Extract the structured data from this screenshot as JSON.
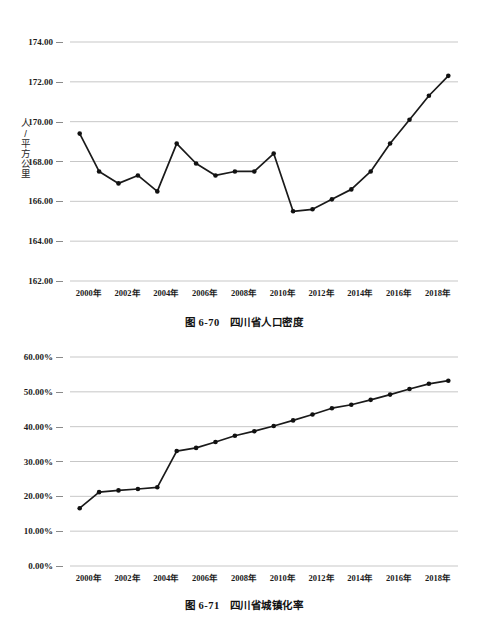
{
  "page": {
    "faint_header": "",
    "background": "#ffffff"
  },
  "figures": [
    {
      "id": "figure-6-70",
      "caption_number": "图 6-70",
      "caption_title": "四川省人口密度",
      "y_axis_title": "人/平方公里"
    },
    {
      "id": "figure-6-71",
      "caption_number": "图 6-71",
      "caption_title": "四川省城镇化率",
      "y_axis_title": ""
    }
  ],
  "chart_data": [
    {
      "type": "line",
      "title": "图 6-70  四川省人口密度",
      "xlabel": "",
      "ylabel": "人/平方公里",
      "ylim": [
        162.0,
        174.0
      ],
      "ytick_labels": [
        "174.00",
        "172.00",
        "170.00",
        "168.00",
        "166.00",
        "164.00",
        "162.00"
      ],
      "ytick_values": [
        174.0,
        172.0,
        170.0,
        168.0,
        166.0,
        164.0,
        162.0
      ],
      "xtick_labels": [
        "2000年",
        "2002年",
        "2004年",
        "2006年",
        "2008年",
        "2010年",
        "2012年",
        "2014年",
        "2016年",
        "2018年"
      ],
      "x": [
        "2000年",
        "2001年",
        "2002年",
        "2003年",
        "2004年",
        "2005年",
        "2006年",
        "2007年",
        "2008年",
        "2009年",
        "2010年",
        "2011年",
        "2012年",
        "2013年",
        "2014年",
        "2015年",
        "2016年",
        "2017年",
        "2018年",
        "2019年"
      ],
      "values": [
        169.4,
        167.5,
        166.9,
        167.3,
        166.5,
        168.9,
        167.9,
        167.3,
        167.5,
        167.5,
        168.4,
        165.5,
        165.6,
        166.1,
        166.6,
        167.5,
        168.9,
        170.1,
        171.3,
        172.3
      ],
      "grid": true,
      "legend": "none",
      "markers": true,
      "line_color": "#1a1a1a"
    },
    {
      "type": "line",
      "title": "图 6-71  四川省城镇化率",
      "xlabel": "",
      "ylabel": "",
      "ylim": [
        0.0,
        60.0
      ],
      "ytick_labels": [
        "60.00%",
        "50.00%",
        "40.00%",
        "30.00%",
        "20.00%",
        "10.00%",
        "0.00%"
      ],
      "ytick_values": [
        60.0,
        50.0,
        40.0,
        30.0,
        20.0,
        10.0,
        0.0
      ],
      "xtick_labels": [
        "2000年",
        "2002年",
        "2004年",
        "2006年",
        "2008年",
        "2010年",
        "2012年",
        "2014年",
        "2016年",
        "2018年"
      ],
      "x": [
        "2000年",
        "2001年",
        "2002年",
        "2003年",
        "2004年",
        "2005年",
        "2006年",
        "2007年",
        "2008年",
        "2009年",
        "2010年",
        "2011年",
        "2012年",
        "2013年",
        "2014年",
        "2015年",
        "2016年",
        "2017年",
        "2018年",
        "2019年"
      ],
      "values": [
        16.6,
        21.2,
        21.7,
        22.1,
        22.6,
        33.0,
        33.9,
        35.6,
        37.4,
        38.7,
        40.2,
        41.8,
        43.5,
        45.3,
        46.3,
        47.7,
        49.2,
        50.8,
        52.3,
        53.2
      ],
      "grid": true,
      "legend": "none",
      "markers": true,
      "line_color": "#1a1a1a"
    }
  ]
}
